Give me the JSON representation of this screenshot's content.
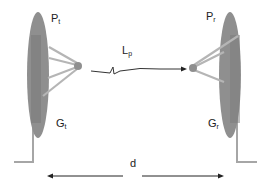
{
  "diagram": {
    "colors": {
      "dish": "#8f8f8f",
      "dish_dark": "#7c7c7c",
      "pole": "#a6a6a6",
      "strut": "#b5b5b5",
      "wave": "#333333",
      "arrow": "#222222",
      "text": "#222222"
    },
    "transmitter": {
      "power_label": {
        "main": "P",
        "sub": "t"
      },
      "gain_label": {
        "main": "G",
        "sub": "t"
      }
    },
    "receiver": {
      "power_label": {
        "main": "P",
        "sub": "r"
      },
      "gain_label": {
        "main": "G",
        "sub": "r"
      }
    },
    "path_loss_label": {
      "main": "L",
      "sub": "p"
    },
    "distance_label": "d"
  }
}
